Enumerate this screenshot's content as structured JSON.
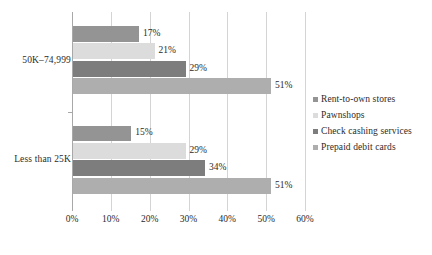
{
  "chart_data": {
    "type": "bar",
    "orientation": "horizontal",
    "title": "",
    "xlabel": "",
    "ylabel": "",
    "categories": [
      "50K–74,999",
      "Less than 25K"
    ],
    "series": [
      {
        "name": "Rent-to-own stores",
        "values": [
          17,
          15
        ],
        "color": "#949494"
      },
      {
        "name": "Pawnshops",
        "values": [
          21,
          29
        ],
        "color": "#dcdcdc"
      },
      {
        "name": "Check cashing services",
        "values": [
          29,
          34
        ],
        "color": "#7d7d7d"
      },
      {
        "name": "Prepaid debit cards",
        "values": [
          51,
          51
        ],
        "color": "#aeaeae"
      }
    ],
    "data_labels": [
      [
        "17%",
        "21%",
        "29%",
        "51%"
      ],
      [
        "15%",
        "29%",
        "34%",
        "51%"
      ]
    ],
    "xlim": [
      0,
      60
    ],
    "xticks": [
      0,
      10,
      20,
      30,
      40,
      50,
      60
    ],
    "xtick_labels": [
      "0%",
      "10%",
      "20%",
      "30%",
      "40%",
      "50%",
      "60%"
    ],
    "grid": true,
    "legend_position": "right",
    "value_unit": "%"
  },
  "legend": {
    "items": [
      {
        "label": "Rent-to-own stores",
        "color": "#949494"
      },
      {
        "label": "Pawnshops",
        "color": "#dcdcdc"
      },
      {
        "label": "Check cashing services",
        "color": "#7d7d7d"
      },
      {
        "label": "Prepaid debit cards",
        "color": "#aeaeae"
      }
    ]
  },
  "axis": {
    "gridline_color": "#d4d4d4",
    "axis_color": "#a8a8a8",
    "text_color": "#2b2b2b"
  }
}
